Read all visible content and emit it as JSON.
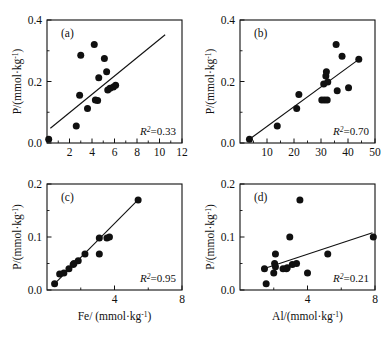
{
  "figure": {
    "type": "multi-panel-scatter",
    "panel_count": 4,
    "layout": "2x2",
    "marker_color": "#101010",
    "line_color": "#101010",
    "background": "#ffffff"
  },
  "axis_titles": {
    "y_common": "P/(mmol·kg",
    "y_common_sup": "-1",
    "y_common_tail": ")",
    "x_c": "Fe/ (mmol·kg",
    "x_c_sup": "-1",
    "x_c_tail": ")",
    "x_d": "Al/(mmol·kg",
    "x_d_sup": "-1",
    "x_d_tail": ")",
    "r2_symbol": "R",
    "r2_sup": "2"
  },
  "chart_data": [
    {
      "panel": "a",
      "type": "scatter",
      "title": "(a)",
      "xlabel": "",
      "ylabel": "P/(mmol·kg-1)",
      "xlim": [
        0,
        12
      ],
      "ylim": [
        0,
        0.4
      ],
      "xticks_major": [
        2,
        4,
        6,
        8,
        10,
        12
      ],
      "xticks_minor": [
        1,
        3,
        5,
        7,
        9,
        11
      ],
      "yticks_major": [
        0.0,
        0.2,
        0.4
      ],
      "yticks_minor": [
        0.1,
        0.3
      ],
      "grid": false,
      "legend": "none",
      "annotation": "R2=0.33",
      "r2_value": "0.33",
      "r2_text": "=0.33",
      "points": [
        {
          "x": 0.15,
          "y": 0.012
        },
        {
          "x": 2.6,
          "y": 0.055
        },
        {
          "x": 2.9,
          "y": 0.155
        },
        {
          "x": 3.0,
          "y": 0.285
        },
        {
          "x": 3.6,
          "y": 0.112
        },
        {
          "x": 4.2,
          "y": 0.32
        },
        {
          "x": 4.3,
          "y": 0.14
        },
        {
          "x": 4.5,
          "y": 0.138
        },
        {
          "x": 4.6,
          "y": 0.212
        },
        {
          "x": 5.1,
          "y": 0.275
        },
        {
          "x": 5.3,
          "y": 0.232
        },
        {
          "x": 5.4,
          "y": 0.172
        },
        {
          "x": 5.6,
          "y": 0.178
        },
        {
          "x": 5.9,
          "y": 0.182
        },
        {
          "x": 6.1,
          "y": 0.188
        }
      ],
      "trendline": {
        "x1": 0.3,
        "y1": 0.048,
        "x2": 10.5,
        "y2": 0.352
      }
    },
    {
      "panel": "b",
      "type": "scatter",
      "title": "(b)",
      "xlabel": "",
      "ylabel": "P/(mmol·kg-1)",
      "xlim": [
        0,
        50
      ],
      "ylim": [
        0,
        0.4
      ],
      "xticks_major": [
        10,
        20,
        30,
        40,
        50
      ],
      "xticks_minor": [
        5,
        15,
        25,
        35,
        45
      ],
      "yticks_major": [
        0.0,
        0.2,
        0.4
      ],
      "yticks_minor": [
        0.1,
        0.3
      ],
      "grid": false,
      "legend": "none",
      "annotation": "R2=0.70",
      "r2_value": "0.70",
      "r2_text": "=0.70",
      "points": [
        {
          "x": 3.5,
          "y": 0.012
        },
        {
          "x": 13.8,
          "y": 0.055
        },
        {
          "x": 21.0,
          "y": 0.112
        },
        {
          "x": 21.8,
          "y": 0.158
        },
        {
          "x": 30.3,
          "y": 0.14
        },
        {
          "x": 31.0,
          "y": 0.192
        },
        {
          "x": 31.3,
          "y": 0.14
        },
        {
          "x": 31.8,
          "y": 0.218
        },
        {
          "x": 32.0,
          "y": 0.232
        },
        {
          "x": 32.3,
          "y": 0.14
        },
        {
          "x": 32.5,
          "y": 0.198
        },
        {
          "x": 35.6,
          "y": 0.32
        },
        {
          "x": 36.0,
          "y": 0.17
        },
        {
          "x": 37.8,
          "y": 0.282
        },
        {
          "x": 40.2,
          "y": 0.18
        },
        {
          "x": 44.0,
          "y": 0.272
        }
      ],
      "trendline": {
        "x1": 3.5,
        "y1": 0.012,
        "x2": 44.0,
        "y2": 0.272
      }
    },
    {
      "panel": "c",
      "type": "scatter",
      "title": "(c)",
      "xlabel": "Fe/ (mmol·kg-1)",
      "ylabel": "P/(mmol·kg-1)",
      "xlim": [
        0,
        8
      ],
      "ylim": [
        0,
        0.2
      ],
      "xticks_major": [
        4,
        8
      ],
      "xticks_minor": [
        2,
        6
      ],
      "yticks_major": [
        0.0,
        0.1,
        0.2
      ],
      "yticks_minor": [
        0.05,
        0.15
      ],
      "grid": false,
      "legend": "none",
      "annotation": "R2=0.95",
      "r2_value": "0.95",
      "r2_text": "=0.95",
      "points": [
        {
          "x": 0.45,
          "y": 0.012
        },
        {
          "x": 0.75,
          "y": 0.03
        },
        {
          "x": 1.0,
          "y": 0.032
        },
        {
          "x": 1.3,
          "y": 0.04
        },
        {
          "x": 1.55,
          "y": 0.048
        },
        {
          "x": 1.6,
          "y": 0.05
        },
        {
          "x": 1.85,
          "y": 0.055
        },
        {
          "x": 2.25,
          "y": 0.068
        },
        {
          "x": 3.1,
          "y": 0.068
        },
        {
          "x": 3.1,
          "y": 0.098
        },
        {
          "x": 3.55,
          "y": 0.098
        },
        {
          "x": 3.7,
          "y": 0.1
        },
        {
          "x": 5.4,
          "y": 0.17
        }
      ],
      "trendline": {
        "x1": 0.4,
        "y1": 0.01,
        "x2": 5.45,
        "y2": 0.172
      }
    },
    {
      "panel": "d",
      "type": "scatter",
      "title": "(d)",
      "xlabel": "Al/(mmol·kg-1)",
      "ylabel": "P/(mmol·kg-1)",
      "xlim": [
        0,
        8
      ],
      "ylim": [
        0,
        0.2
      ],
      "xticks_major": [
        4,
        8
      ],
      "xticks_minor": [
        2,
        6
      ],
      "yticks_major": [
        0.0,
        0.1,
        0.2
      ],
      "yticks_minor": [
        0.05,
        0.15
      ],
      "grid": false,
      "legend": "none",
      "annotation": "R2=0.21",
      "r2_value": "0.21",
      "r2_text": "=0.21",
      "points": [
        {
          "x": 1.55,
          "y": 0.012
        },
        {
          "x": 1.45,
          "y": 0.04
        },
        {
          "x": 2.1,
          "y": 0.068
        },
        {
          "x": 2.05,
          "y": 0.05
        },
        {
          "x": 2.0,
          "y": 0.032
        },
        {
          "x": 2.1,
          "y": 0.044
        },
        {
          "x": 2.55,
          "y": 0.04
        },
        {
          "x": 2.75,
          "y": 0.04
        },
        {
          "x": 2.8,
          "y": 0.042
        },
        {
          "x": 2.95,
          "y": 0.1
        },
        {
          "x": 3.1,
          "y": 0.048
        },
        {
          "x": 3.55,
          "y": 0.17
        },
        {
          "x": 3.35,
          "y": 0.05
        },
        {
          "x": 4.0,
          "y": 0.032
        },
        {
          "x": 5.2,
          "y": 0.068
        },
        {
          "x": 7.9,
          "y": 0.1
        }
      ],
      "trendline": {
        "x1": 1.4,
        "y1": 0.04,
        "x2": 7.85,
        "y2": 0.108
      }
    }
  ]
}
